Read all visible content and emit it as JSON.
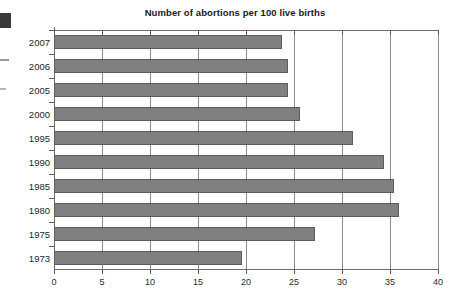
{
  "chart_data": {
    "type": "bar",
    "orientation": "horizontal",
    "title": "Number of abortions per 100 live births",
    "xlabel": "",
    "ylabel": "",
    "categories": [
      "2007",
      "2006",
      "2005",
      "2000",
      "1995",
      "1990",
      "1985",
      "1980",
      "1975",
      "1973"
    ],
    "values": [
      23.8,
      24.4,
      24.4,
      25.6,
      31.1,
      34.4,
      35.4,
      35.9,
      27.2,
      19.6
    ],
    "xlim": [
      0,
      40
    ],
    "xticks": [
      0,
      5,
      10,
      15,
      20,
      25,
      30,
      35,
      40
    ],
    "xtick_labels": [
      "0",
      "5",
      "10",
      "15",
      "20",
      "25",
      "30",
      "35",
      "40"
    ],
    "grid": true,
    "grid_axis": "x",
    "legend": false,
    "bar_color": "#808080",
    "bar_edge_color": "#5c5c5c"
  }
}
